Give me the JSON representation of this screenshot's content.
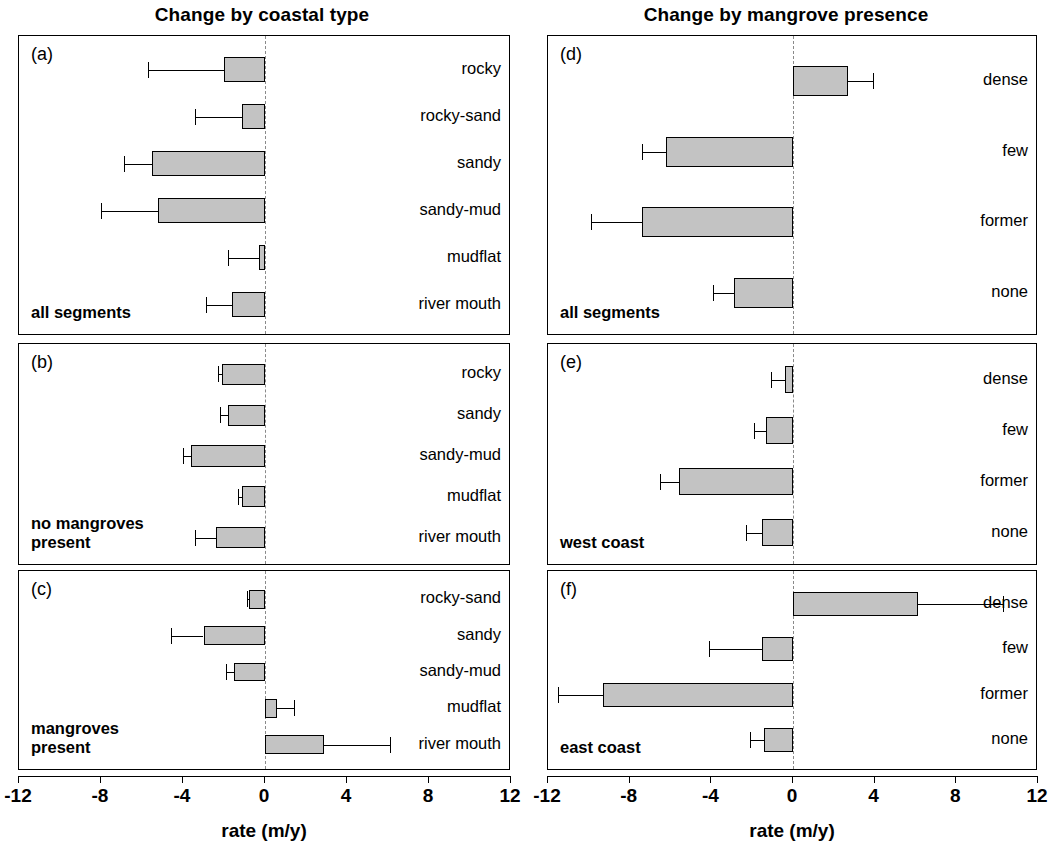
{
  "figure": {
    "left_column_title": "Change by coastal type",
    "right_column_title": "Change by mangrove presence",
    "axis_title": "rate (m/y)",
    "bar_fill_color": "#c3c3c3",
    "bar_edge_color": "#000000",
    "zero_line_color": "#8a8a8a"
  },
  "axis": {
    "min": -12,
    "max": 12,
    "ticks": [
      -12,
      -8,
      -4,
      0,
      4,
      8,
      12
    ],
    "tick_labels": [
      "-12",
      "-8",
      "-4",
      "0",
      "4",
      "8",
      "12"
    ]
  },
  "panels": [
    {
      "letter": "(a)",
      "note": "all segments",
      "column": "left",
      "labels": [
        "rocky",
        "rocky-sand",
        "sandy",
        "sandy-mud",
        "mudflat",
        "river mouth"
      ],
      "values": [
        -2.0,
        -1.1,
        -5.5,
        -5.2,
        -0.3,
        -1.6
      ],
      "errors_low": [
        -5.7,
        -3.4,
        -6.9,
        -8.0,
        -1.8,
        -2.9
      ],
      "errors_high": [
        -2.0,
        -1.1,
        -5.5,
        -5.2,
        -0.3,
        -1.6
      ]
    },
    {
      "letter": "(b)",
      "note": "no mangroves\npresent",
      "column": "left",
      "labels": [
        "rocky",
        "sandy",
        "sandy-mud",
        "mudflat",
        "river mouth"
      ],
      "values": [
        -2.1,
        -1.8,
        -3.6,
        -1.1,
        -2.4
      ],
      "errors_low": [
        -2.3,
        -2.2,
        -4.0,
        -1.3,
        -3.4
      ],
      "errors_high": [
        -2.1,
        -1.8,
        -3.6,
        -1.1,
        -2.4
      ]
    },
    {
      "letter": "(c)",
      "note": "mangroves\npresent",
      "column": "left",
      "labels": [
        "rocky-sand",
        "sandy",
        "sandy-mud",
        "mudflat",
        "river mouth"
      ],
      "values": [
        -0.8,
        -3.0,
        -1.5,
        0.6,
        2.9
      ],
      "errors_low": [
        -0.9,
        -4.6,
        -1.9,
        0.6,
        2.9
      ],
      "errors_high": [
        -0.8,
        -3.0,
        -1.5,
        1.4,
        6.1
      ]
    },
    {
      "letter": "(d)",
      "note": "all segments",
      "column": "right",
      "labels": [
        "dense",
        "few",
        "former",
        "none"
      ],
      "values": [
        2.7,
        -6.2,
        -7.4,
        -2.9
      ],
      "errors_low": [
        2.7,
        -7.4,
        -9.9,
        -3.9
      ],
      "errors_high": [
        3.9,
        -6.2,
        -7.4,
        -2.9
      ]
    },
    {
      "letter": "(e)",
      "note": "west coast",
      "column": "right",
      "labels": [
        "dense",
        "few",
        "former",
        "none"
      ],
      "values": [
        -0.4,
        -1.3,
        -5.6,
        -1.5
      ],
      "errors_low": [
        -1.1,
        -1.9,
        -6.5,
        -2.3
      ],
      "errors_high": [
        -0.4,
        -1.3,
        -5.6,
        -1.5
      ]
    },
    {
      "letter": "(f)",
      "note": "east coast",
      "column": "right",
      "labels": [
        "dense",
        "few",
        "former",
        "none"
      ],
      "values": [
        6.1,
        -1.5,
        -9.3,
        -1.4
      ],
      "errors_low": [
        6.1,
        -4.1,
        -11.5,
        -2.1
      ],
      "errors_high": [
        10.3,
        -1.5,
        -9.3,
        -1.4
      ]
    }
  ],
  "chart_data": {
    "type": "bar",
    "orientation": "horizontal",
    "xlabel": "rate (m/y)",
    "ylabel": "",
    "xlim": [
      -12,
      12
    ],
    "xticks": [
      -12,
      -8,
      -4,
      0,
      4,
      8,
      12
    ],
    "grid": false,
    "legend": "none",
    "error_bars": "one-sided (extending away from zero)",
    "subplots": [
      {
        "panel": "(a)",
        "subtitle": "Change by coastal type",
        "annotation": "all segments",
        "categories": [
          "rocky",
          "rocky-sand",
          "sandy",
          "sandy-mud",
          "mudflat",
          "river mouth"
        ],
        "values": [
          -2.0,
          -1.1,
          -5.5,
          -5.2,
          -0.3,
          -1.6
        ],
        "error_extents": [
          -5.7,
          -3.4,
          -6.9,
          -8.0,
          -1.8,
          -2.9
        ]
      },
      {
        "panel": "(b)",
        "subtitle": "Change by coastal type",
        "annotation": "no mangroves present",
        "categories": [
          "rocky",
          "sandy",
          "sandy-mud",
          "mudflat",
          "river mouth"
        ],
        "values": [
          -2.1,
          -1.8,
          -3.6,
          -1.1,
          -2.4
        ],
        "error_extents": [
          -2.3,
          -2.2,
          -4.0,
          -1.3,
          -3.4
        ]
      },
      {
        "panel": "(c)",
        "subtitle": "Change by coastal type",
        "annotation": "mangroves present",
        "categories": [
          "rocky-sand",
          "sandy",
          "sandy-mud",
          "mudflat",
          "river mouth"
        ],
        "values": [
          -0.8,
          -3.0,
          -1.5,
          0.6,
          2.9
        ],
        "error_extents": [
          -0.9,
          -4.6,
          -1.9,
          1.4,
          6.1
        ]
      },
      {
        "panel": "(d)",
        "subtitle": "Change by mangrove presence",
        "annotation": "all segments",
        "categories": [
          "dense",
          "few",
          "former",
          "none"
        ],
        "values": [
          2.7,
          -6.2,
          -7.4,
          -2.9
        ],
        "error_extents": [
          3.9,
          -7.4,
          -9.9,
          -3.9
        ]
      },
      {
        "panel": "(e)",
        "subtitle": "Change by mangrove presence",
        "annotation": "west coast",
        "categories": [
          "dense",
          "few",
          "former",
          "none"
        ],
        "values": [
          -0.4,
          -1.3,
          -5.6,
          -1.5
        ],
        "error_extents": [
          -1.1,
          -1.9,
          -6.5,
          -2.3
        ]
      },
      {
        "panel": "(f)",
        "subtitle": "Change by mangrove presence",
        "annotation": "east coast",
        "categories": [
          "dense",
          "few",
          "former",
          "none"
        ],
        "values": [
          6.1,
          -1.5,
          -9.3,
          -1.4
        ],
        "error_extents": [
          10.3,
          -4.1,
          -11.5,
          -2.1
        ]
      }
    ]
  }
}
